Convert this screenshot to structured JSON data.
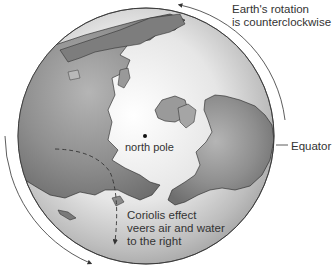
{
  "diagram": {
    "labels": {
      "rotation_line1": "Earth's rotation",
      "rotation_line2": "is counterclockwise",
      "equator": "Equator",
      "north_pole": "north pole",
      "coriolis_line1": "Coriolis effect",
      "coriolis_line2": "veers air and water",
      "coriolis_line3": "to the right"
    },
    "colors": {
      "ocean_light": "#f4f4f4",
      "ocean_dark": "#9a9a9a",
      "land": "#8c8c8c",
      "land_edge": "#222222",
      "arrow": "#333333",
      "text": "#333333"
    },
    "icons": {
      "rotation_arrow": "curved-arrow-counterclockwise",
      "deflection_arrow": "dashed-curved-arrow",
      "pole_marker": "dot"
    }
  }
}
